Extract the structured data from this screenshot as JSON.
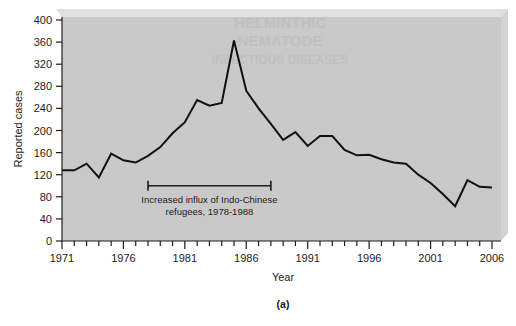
{
  "figure": {
    "caption": "(a)",
    "panel_bg_color": "#c9c9c9",
    "panel_bevel_color": "#dcdcdc",
    "line_color": "#111111",
    "text_color": "#1c1c1c"
  },
  "chart_data": {
    "type": "line",
    "title": "",
    "xlabel": "Year",
    "ylabel": "Reported cases",
    "xlim": [
      1971,
      2006
    ],
    "ylim": [
      0,
      400
    ],
    "ytick_step": 40,
    "yticks": [
      0,
      40,
      80,
      120,
      160,
      200,
      240,
      280,
      320,
      360,
      400
    ],
    "ytick_labels": [
      "0",
      "40",
      "80",
      "120",
      "160",
      "200",
      "240",
      "280",
      "320",
      "360",
      "400"
    ],
    "xticks_major": [
      1971,
      1976,
      1981,
      1986,
      1991,
      1996,
      2001,
      2006
    ],
    "xtick_labels": [
      "1971",
      "1976",
      "1981",
      "1986",
      "1991",
      "1996",
      "2001",
      "2006"
    ],
    "xtick_minor_step": 1,
    "grid": false,
    "legend": null,
    "series": [
      {
        "name": "Reported cases",
        "x": [
          1971,
          1972,
          1973,
          1974,
          1975,
          1976,
          1977,
          1978,
          1979,
          1980,
          1981,
          1982,
          1983,
          1984,
          1985,
          1986,
          1987,
          1988,
          1989,
          1990,
          1991,
          1992,
          1993,
          1994,
          1995,
          1996,
          1997,
          1998,
          1999,
          2000,
          2001,
          2002,
          2003,
          2004,
          2005,
          2006
        ],
        "values": [
          128,
          128,
          140,
          115,
          158,
          146,
          142,
          154,
          170,
          195,
          215,
          255,
          245,
          250,
          363,
          272,
          240,
          212,
          183,
          197,
          172,
          190,
          190,
          165,
          155,
          156,
          148,
          142,
          140,
          120,
          105,
          85,
          63,
          110,
          98,
          97
        ]
      }
    ],
    "annotations": [
      {
        "name": "influx-bracket",
        "type": "range-bar",
        "x_start": 1978,
        "x_end": 1988,
        "y": 100,
        "label_line_1": "Increased influx of Indo-Chinese",
        "label_line_2": "refugees, 1978-1988"
      }
    ]
  },
  "bleed_through": {
    "line_1": "HELMINTHIC",
    "line_2": "NEMATODE",
    "line_3": "INFECTIOUS DISEASES"
  }
}
